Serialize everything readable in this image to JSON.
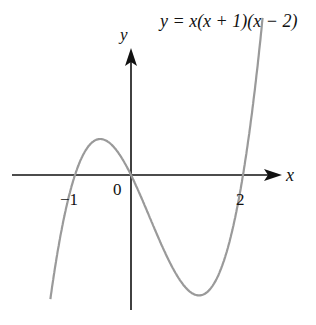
{
  "chart_data": {
    "type": "line",
    "title": "y = x(x + 1)(x − 2)",
    "equation": "y = x(x + 1)(x - 2)",
    "xlabel": "x",
    "ylabel": "y",
    "origin_label": "0",
    "x_tick_labels": [
      "-1",
      "2"
    ],
    "roots": [
      -1,
      0,
      2
    ],
    "local_max": {
      "x": -0.55,
      "y": 0.63
    },
    "local_min": {
      "x": 1.22,
      "y": -2.11
    },
    "xlim": [
      -2.2,
      2.6
    ],
    "ylim": [
      -2.6,
      3.0
    ],
    "grid": false,
    "curve_color": "#9a9a9a",
    "axis_color": "#111111"
  },
  "labels": {
    "equation": "y = x(x + 1)(x − 2)",
    "y_axis": "y",
    "x_axis": "x",
    "origin": "0",
    "tick_neg1": "−1",
    "tick_2": "2"
  }
}
